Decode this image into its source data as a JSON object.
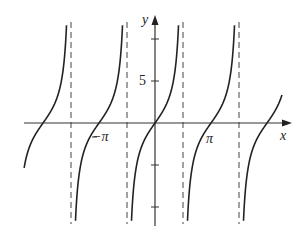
{
  "chart_data": {
    "type": "line",
    "title": "",
    "function": "y = 3 tan x",
    "xlabel": "x",
    "ylabel": "y",
    "x_tick_labels": [
      "-π",
      "π"
    ],
    "y_tick_labels": [
      "5"
    ],
    "y_ticks": [
      -10,
      -5,
      5,
      10
    ],
    "xlim": [
      -4.0,
      4.4
    ],
    "ylim": [
      -12,
      13
    ],
    "asymptotes": [
      "-3π/2",
      "-π/2",
      "π/2",
      "3π/2"
    ],
    "zeros": [
      "-2π",
      "-π",
      "0",
      "π",
      "2π"
    ],
    "grid": false,
    "line_color": "#222222"
  },
  "labels": {
    "x_axis": "x",
    "y_axis": "y",
    "neg_pi": "−π",
    "pi": "π",
    "five": "5"
  }
}
